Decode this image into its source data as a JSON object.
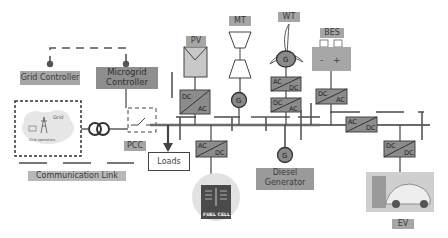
{
  "diagram": {
    "labels": {
      "grid_controller": "Grid Controller",
      "microgrid_controller_line1": "Microgrid",
      "microgrid_controller_line2": "Controller",
      "grid": "Grid",
      "grid_operators": "Grid operators",
      "pcc": "PCC",
      "communication_link": "Communication Link",
      "loads": "Loads",
      "pv": "PV",
      "mt": "MT",
      "wt": "WT",
      "bes": "BES",
      "diesel_line1": "Diesel",
      "diesel_line2": "Generator",
      "ev": "EV",
      "fuel_cell": "FUEL CELL",
      "generator_symbol": "G",
      "battery_minus": "-",
      "battery_plus": "+"
    },
    "converters": {
      "pv": {
        "top": "DC",
        "bottom": "AC"
      },
      "wt_upper": {
        "top": "AC",
        "bottom": "DC"
      },
      "wt_lower": {
        "top": "DC",
        "bottom": "AC"
      },
      "bes": {
        "top": "DC",
        "bottom": "AC"
      },
      "fuel_cell": {
        "top": "AC",
        "bottom": "DC"
      },
      "bus_link": {
        "top": "AC",
        "bottom": "DC"
      },
      "ev": {
        "top": "DC",
        "bottom": "DC"
      }
    },
    "colors": {
      "label_bg": "#a6a6a6",
      "controller_bg": "#8e8e8e",
      "converter_fill": "#8c8c8c",
      "bus_line": "#6a6a6a",
      "generator_fill": "#8a8a8a"
    }
  }
}
